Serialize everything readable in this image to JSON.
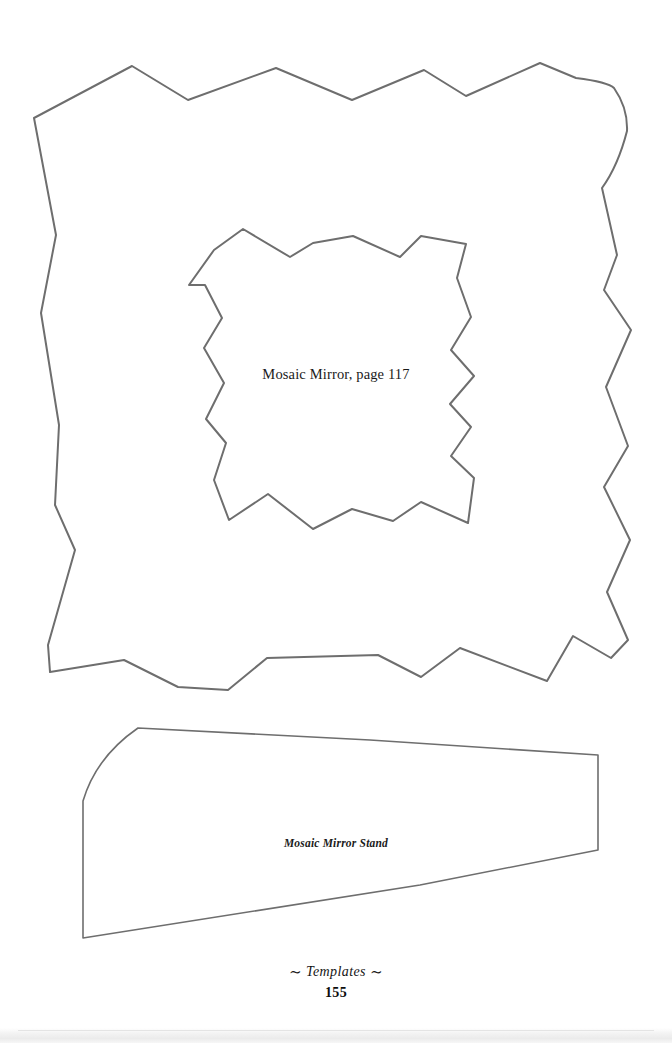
{
  "page": {
    "kind": "craft-book-template-page",
    "width": 672,
    "height": 1043,
    "background_color": "#ffffff",
    "ink_color": "#6e6e6e",
    "text_color": "#1a1a1a"
  },
  "templates": {
    "mirror": {
      "label": "Mosaic Mirror, page 117",
      "outline_name": "mosaic-mirror-frame-outline",
      "inner_cutout_name": "mosaic-mirror-inner-cutout"
    },
    "stand": {
      "label": "Mosaic Mirror Stand",
      "outline_name": "mosaic-mirror-stand-outline"
    }
  },
  "footer": {
    "ornament_left": "∼",
    "section": "Templates",
    "ornament_right": "∼",
    "page_number": "155"
  },
  "shapes": {
    "mirror_outer_points": "132,66 188,100 276,68 352,100 424,70 466,96 540,63 576,78 614,88 627,131 602,188 617,255 604,290 631,330 606,387 628,446 604,487 630,540 607,592 628,640 611,658 573,636 547,681 460,648 421,677 378,655 267,658 228,690 178,687 124,660 50,672 48,645 75,550 55,505 59,425 41,313 56,235 34,118",
    "mirror_inner_points": "243,229 290,257 313,243 353,236 400,257 421,236 466,244 457,278 471,317 451,350 474,376 450,404 471,427 451,456 474,478 468,523 421,502 393,521 352,509 313,529 268,494 229,520 214,480 226,443 206,419 224,383 204,348 222,318 205,285 189,285 214,250",
    "stand_points": "138,728 370,740 598,755 598,850 420,885 83,938 83,801",
    "stand_curve": {
      "from": "138,728",
      "control": "100,760",
      "to": "83,801"
    }
  }
}
